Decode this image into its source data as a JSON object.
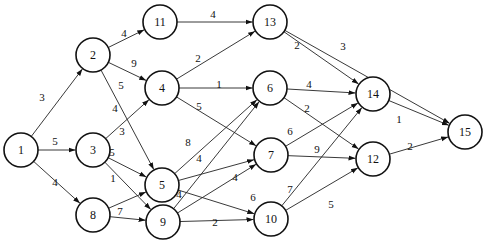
{
  "diagram": {
    "type": "directed-weighted-network",
    "node_radius": 17,
    "nodes": [
      {
        "id": "1",
        "label": "1",
        "x": 21,
        "y": 150
      },
      {
        "id": "2",
        "label": "2",
        "x": 93,
        "y": 55
      },
      {
        "id": "3",
        "label": "3",
        "x": 93,
        "y": 150
      },
      {
        "id": "8",
        "label": "8",
        "x": 93,
        "y": 215
      },
      {
        "id": "11",
        "label": "11",
        "x": 160,
        "y": 22
      },
      {
        "id": "4",
        "label": "4",
        "x": 162,
        "y": 88
      },
      {
        "id": "5",
        "label": "5",
        "x": 162,
        "y": 185
      },
      {
        "id": "9",
        "label": "9",
        "x": 163,
        "y": 222
      },
      {
        "id": "13",
        "label": "13",
        "x": 270,
        "y": 22
      },
      {
        "id": "6",
        "label": "6",
        "x": 270,
        "y": 88
      },
      {
        "id": "7",
        "label": "7",
        "x": 271,
        "y": 155
      },
      {
        "id": "10",
        "label": "10",
        "x": 271,
        "y": 219
      },
      {
        "id": "14",
        "label": "14",
        "x": 373,
        "y": 94
      },
      {
        "id": "12",
        "label": "12",
        "x": 373,
        "y": 159
      },
      {
        "id": "15",
        "label": "15",
        "x": 465,
        "y": 132
      }
    ],
    "edges": [
      {
        "from": "1",
        "to": "2",
        "weight": "3",
        "lx": 42,
        "ly": 97
      },
      {
        "from": "1",
        "to": "3",
        "weight": "5",
        "lx": 55,
        "ly": 141
      },
      {
        "from": "1",
        "to": "8",
        "weight": "4",
        "lx": 55,
        "ly": 182
      },
      {
        "from": "2",
        "to": "11",
        "weight": "4",
        "lx": 124,
        "ly": 33
      },
      {
        "from": "2",
        "to": "4",
        "weight": "9",
        "lx": 134,
        "ly": 63
      },
      {
        "from": "2",
        "to": "5",
        "weight": "5",
        "lx": 121,
        "ly": 85
      },
      {
        "from": "3",
        "to": "4",
        "weight": "4",
        "lx": 115,
        "ly": 108
      },
      {
        "from": "3",
        "to": "5",
        "weight": "3",
        "lx": 122,
        "ly": 131
      },
      {
        "from": "3",
        "to": "9",
        "weight": "5",
        "lx": 112,
        "ly": 152
      },
      {
        "from": "8",
        "to": "5",
        "weight": "1",
        "lx": 113,
        "ly": 178
      },
      {
        "from": "8",
        "to": "9",
        "weight": "7",
        "lx": 120,
        "ly": 211
      },
      {
        "from": "11",
        "to": "13",
        "weight": "4",
        "lx": 213,
        "ly": 14
      },
      {
        "from": "4",
        "to": "13",
        "weight": "2",
        "lx": 198,
        "ly": 58
      },
      {
        "from": "4",
        "to": "6",
        "weight": "1",
        "lx": 219,
        "ly": 84
      },
      {
        "from": "4",
        "to": "7",
        "weight": "5",
        "lx": 199,
        "ly": 106
      },
      {
        "from": "5",
        "to": "6",
        "weight": "8",
        "lx": 188,
        "ly": 142
      },
      {
        "from": "5",
        "to": "7",
        "weight": "4",
        "lx": 199,
        "ly": 158
      },
      {
        "from": "5",
        "to": "10",
        "weight": "6",
        "lx": 253,
        "ly": 197
      },
      {
        "from": "9",
        "to": "6",
        "weight": "4",
        "lx": 179,
        "ly": 194
      },
      {
        "from": "9",
        "to": "7",
        "weight": "4",
        "lx": 235,
        "ly": 177
      },
      {
        "from": "9",
        "to": "10",
        "weight": "2",
        "lx": 215,
        "ly": 222
      },
      {
        "from": "13",
        "to": "14",
        "weight": "2",
        "lx": 297,
        "ly": 45
      },
      {
        "from": "13",
        "to": "15",
        "weight": "3",
        "lx": 343,
        "ly": 46
      },
      {
        "from": "6",
        "to": "14",
        "weight": "4",
        "lx": 309,
        "ly": 84
      },
      {
        "from": "6",
        "to": "12",
        "weight": "2",
        "lx": 307,
        "ly": 108
      },
      {
        "from": "7",
        "to": "14",
        "weight": "6",
        "lx": 290,
        "ly": 131
      },
      {
        "from": "7",
        "to": "12",
        "weight": "9",
        "lx": 317,
        "ly": 149
      },
      {
        "from": "10",
        "to": "14",
        "weight": "7",
        "lx": 290,
        "ly": 189
      },
      {
        "from": "10",
        "to": "12",
        "weight": "5",
        "lx": 331,
        "ly": 204
      },
      {
        "from": "14",
        "to": "15",
        "weight": "1",
        "lx": 399,
        "ly": 119
      },
      {
        "from": "12",
        "to": "15",
        "weight": "2",
        "lx": 410,
        "ly": 146
      }
    ]
  }
}
